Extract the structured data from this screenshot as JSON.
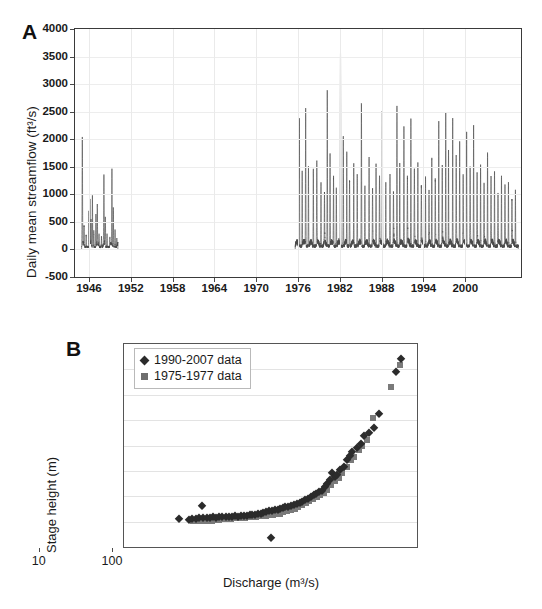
{
  "figure": {
    "panels": [
      {
        "letter": "A",
        "ylabel": "Daily mean streamflow (ft³/s)",
        "xlabel": ""
      },
      {
        "letter": "B",
        "ylabel": "Stage height (m)",
        "xlabel": "Discharge (m³/s)"
      }
    ]
  },
  "chart_data": [
    {
      "type": "line",
      "title": "",
      "panel": "A",
      "xlabel": "",
      "ylabel": "Daily mean streamflow (ft³/s)",
      "xlim": [
        1944.0,
        2008.0
      ],
      "ylim": [
        -500,
        4000
      ],
      "yticks": [
        -500,
        0,
        500,
        1000,
        1500,
        2000,
        2500,
        3000,
        3500,
        4000
      ],
      "ytick_labels": [
        "-500",
        "0",
        "500",
        "1000",
        "1500",
        "2000",
        "2500",
        "3000",
        "3500",
        "4000"
      ],
      "xticks": [
        1946,
        1952,
        1958,
        1964,
        1970,
        1976,
        1982,
        1988,
        1994,
        2000
      ],
      "xtick_labels": [
        "1946",
        "1952",
        "1958",
        "1964",
        "1970",
        "1976",
        "1982",
        "1988",
        "1994",
        "2000"
      ],
      "grid": true,
      "legend": "none",
      "series": [
        {
          "name": "Daily mean streamflow",
          "color": "#4a4a4a",
          "note": "Gauge record has two eras: an early record ~1945-1950 and a continuous record from ~1975 to ~2007; the 1951-1974 interval is a data gap.",
          "segments": [
            {
              "era": "1945-1950",
              "peaks": [
                {
                  "x": 1945.05,
                  "y": 1950
                },
                {
                  "x": 1945.3,
                  "y": 330
                },
                {
                  "x": 1945.6,
                  "y": 210
                },
                {
                  "x": 1946.0,
                  "y": 620
                },
                {
                  "x": 1946.15,
                  "y": 780
                },
                {
                  "x": 1946.3,
                  "y": 450
                },
                {
                  "x": 1946.5,
                  "y": 930
                },
                {
                  "x": 1946.7,
                  "y": 300
                },
                {
                  "x": 1947.0,
                  "y": 560
                },
                {
                  "x": 1947.2,
                  "y": 680
                },
                {
                  "x": 1947.45,
                  "y": 240
                },
                {
                  "x": 1947.8,
                  "y": 180
                },
                {
                  "x": 1948.15,
                  "y": 1260
                },
                {
                  "x": 1948.35,
                  "y": 500
                },
                {
                  "x": 1948.6,
                  "y": 230
                },
                {
                  "x": 1949.0,
                  "y": 160
                },
                {
                  "x": 1949.3,
                  "y": 1400
                },
                {
                  "x": 1949.5,
                  "y": 700
                },
                {
                  "x": 1949.75,
                  "y": 300
                },
                {
                  "x": 1950.0,
                  "y": 120
                }
              ]
            },
            {
              "era": "1975-2007",
              "annual_peaks": [
                {
                  "year": 1976.2,
                  "y": 2300
                },
                {
                  "year": 1976.6,
                  "y": 1350
                },
                {
                  "year": 1977.1,
                  "y": 2500
                },
                {
                  "year": 1977.5,
                  "y": 1450
                },
                {
                  "year": 1978.2,
                  "y": 1400
                },
                {
                  "year": 1978.7,
                  "y": 1500
                },
                {
                  "year": 1979.3,
                  "y": 1150
                },
                {
                  "year": 1979.8,
                  "y": 900
                },
                {
                  "year": 1980.2,
                  "y": 2850
                },
                {
                  "year": 1980.6,
                  "y": 1700
                },
                {
                  "year": 1981.1,
                  "y": 1250
                },
                {
                  "year": 1981.5,
                  "y": 1050
                },
                {
                  "year": 1982.1,
                  "y": 3500
                },
                {
                  "year": 1982.5,
                  "y": 2000
                },
                {
                  "year": 1983.0,
                  "y": 1700
                },
                {
                  "year": 1983.4,
                  "y": 1200
                },
                {
                  "year": 1984.0,
                  "y": 1450
                },
                {
                  "year": 1984.5,
                  "y": 1300
                },
                {
                  "year": 1985.1,
                  "y": 2600
                },
                {
                  "year": 1985.6,
                  "y": 1100
                },
                {
                  "year": 1986.2,
                  "y": 1600
                },
                {
                  "year": 1986.7,
                  "y": 1000
                },
                {
                  "year": 1987.2,
                  "y": 1500
                },
                {
                  "year": 1987.7,
                  "y": 1200
                },
                {
                  "year": 1988.1,
                  "y": 2450
                },
                {
                  "year": 1988.6,
                  "y": 1150
                },
                {
                  "year": 1989.2,
                  "y": 1300
                },
                {
                  "year": 1989.7,
                  "y": 950
                },
                {
                  "year": 1990.2,
                  "y": 2550
                },
                {
                  "year": 1990.6,
                  "y": 1500
                },
                {
                  "year": 1991.2,
                  "y": 2150
                },
                {
                  "year": 1991.7,
                  "y": 1200
                },
                {
                  "year": 1992.2,
                  "y": 2300
                },
                {
                  "year": 1992.7,
                  "y": 1350
                },
                {
                  "year": 1993.2,
                  "y": 1500
                },
                {
                  "year": 1993.7,
                  "y": 1050
                },
                {
                  "year": 1994.3,
                  "y": 1250
                },
                {
                  "year": 1994.8,
                  "y": 900
                },
                {
                  "year": 1995.2,
                  "y": 1600
                },
                {
                  "year": 1995.7,
                  "y": 1150
                },
                {
                  "year": 1996.2,
                  "y": 2250
                },
                {
                  "year": 1996.7,
                  "y": 1400
                },
                {
                  "year": 1997.2,
                  "y": 2400
                },
                {
                  "year": 1997.6,
                  "y": 1750
                },
                {
                  "year": 1998.2,
                  "y": 2300
                },
                {
                  "year": 1998.7,
                  "y": 1600
                },
                {
                  "year": 1999.2,
                  "y": 1900
                },
                {
                  "year": 1999.7,
                  "y": 1250
                },
                {
                  "year": 2000.2,
                  "y": 2050
                },
                {
                  "year": 2000.7,
                  "y": 1400
                },
                {
                  "year": 2001.2,
                  "y": 2200
                },
                {
                  "year": 2001.7,
                  "y": 1300
                },
                {
                  "year": 2002.2,
                  "y": 1500
                },
                {
                  "year": 2002.7,
                  "y": 1100
                },
                {
                  "year": 2003.2,
                  "y": 1700
                },
                {
                  "year": 2003.7,
                  "y": 1200
                },
                {
                  "year": 2004.2,
                  "y": 1350
                },
                {
                  "year": 2004.7,
                  "y": 900
                },
                {
                  "year": 2005.2,
                  "y": 1250
                },
                {
                  "year": 2005.7,
                  "y": 1050
                },
                {
                  "year": 2006.2,
                  "y": 1150
                },
                {
                  "year": 2006.7,
                  "y": 800
                },
                {
                  "year": 2007.2,
                  "y": 1000
                }
              ],
              "baseflow": 60
            }
          ]
        }
      ]
    },
    {
      "type": "scatter",
      "title": "",
      "panel": "B",
      "xlabel": "Discharge (m³/s)",
      "ylabel": "Stage height (m)",
      "xscale": "log",
      "xlim": [
        0.01,
        100
      ],
      "ylim": [
        0,
        4
      ],
      "xticks": [
        0.01,
        0.1,
        1,
        10,
        100
      ],
      "xtick_labels": [
        "0.01",
        "0.1",
        "1",
        "10",
        "100"
      ],
      "yticks": [
        0,
        0.5,
        1,
        1.5,
        2,
        2.5,
        3,
        3.5,
        4
      ],
      "ytick_labels": [
        "0",
        "0.5",
        "1",
        "1.5",
        "2",
        "2.5",
        "3",
        "3.5",
        "4"
      ],
      "grid": true,
      "legend_position": "top-left",
      "series": [
        {
          "name": "1990-2007 data",
          "marker": "diamond",
          "color": "#2b2b2b",
          "points": [
            [
              0.056,
              0.55
            ],
            [
              0.078,
              0.54
            ],
            [
              0.085,
              0.55
            ],
            [
              0.095,
              0.56
            ],
            [
              0.105,
              0.57
            ],
            [
              0.115,
              0.8
            ],
            [
              0.12,
              0.57
            ],
            [
              0.135,
              0.58
            ],
            [
              0.15,
              0.58
            ],
            [
              0.165,
              0.59
            ],
            [
              0.18,
              0.58
            ],
            [
              0.2,
              0.59
            ],
            [
              0.22,
              0.6
            ],
            [
              0.25,
              0.6
            ],
            [
              0.27,
              0.59
            ],
            [
              0.3,
              0.6
            ],
            [
              0.33,
              0.61
            ],
            [
              0.36,
              0.6
            ],
            [
              0.4,
              0.61
            ],
            [
              0.44,
              0.62
            ],
            [
              0.48,
              0.62
            ],
            [
              0.52,
              0.63
            ],
            [
              0.56,
              0.64
            ],
            [
              0.62,
              0.64
            ],
            [
              0.68,
              0.65
            ],
            [
              0.74,
              0.66
            ],
            [
              0.8,
              0.67
            ],
            [
              0.88,
              0.68
            ],
            [
              0.95,
              0.7
            ],
            [
              1.0,
              0.18
            ],
            [
              1.05,
              0.7
            ],
            [
              1.15,
              0.72
            ],
            [
              1.25,
              0.73
            ],
            [
              1.35,
              0.74
            ],
            [
              1.5,
              0.76
            ],
            [
              1.6,
              0.78
            ],
            [
              1.75,
              0.79
            ],
            [
              1.9,
              0.8
            ],
            [
              2.1,
              0.82
            ],
            [
              2.3,
              0.84
            ],
            [
              2.5,
              0.86
            ],
            [
              2.7,
              0.88
            ],
            [
              3.0,
              0.92
            ],
            [
              3.3,
              0.95
            ],
            [
              3.6,
              0.98
            ],
            [
              3.9,
              1.02
            ],
            [
              4.2,
              1.05
            ],
            [
              4.6,
              1.08
            ],
            [
              5.0,
              1.1
            ],
            [
              5.5,
              1.18
            ],
            [
              6.0,
              1.25
            ],
            [
              6.5,
              1.32
            ],
            [
              7.0,
              1.45
            ],
            [
              7.5,
              1.38
            ],
            [
              8.0,
              1.42
            ],
            [
              9.0,
              1.52
            ],
            [
              10.0,
              1.58
            ],
            [
              11.0,
              1.72
            ],
            [
              12.0,
              1.8
            ],
            [
              13.0,
              1.88
            ],
            [
              15.0,
              1.95
            ],
            [
              17.0,
              2.02
            ],
            [
              19.0,
              2.18
            ],
            [
              22.0,
              2.25
            ],
            [
              26.0,
              2.35
            ],
            [
              30.0,
              2.62
            ],
            [
              52.0,
              3.45
            ],
            [
              60.0,
              3.7
            ]
          ]
        },
        {
          "name": "1975-1977 data",
          "marker": "square",
          "color": "#7a7a7a",
          "points": [
            [
              0.088,
              0.52
            ],
            [
              0.1,
              0.52
            ],
            [
              0.115,
              0.51
            ],
            [
              0.13,
              0.51
            ],
            [
              0.145,
              0.52
            ],
            [
              0.16,
              0.52
            ],
            [
              0.18,
              0.53
            ],
            [
              0.2,
              0.54
            ],
            [
              0.23,
              0.55
            ],
            [
              0.26,
              0.56
            ],
            [
              0.29,
              0.56
            ],
            [
              0.32,
              0.57
            ],
            [
              0.36,
              0.57
            ],
            [
              0.4,
              0.58
            ],
            [
              0.45,
              0.58
            ],
            [
              0.5,
              0.59
            ],
            [
              0.56,
              0.6
            ],
            [
              0.63,
              0.6
            ],
            [
              0.7,
              0.61
            ],
            [
              0.78,
              0.62
            ],
            [
              0.87,
              0.62
            ],
            [
              0.97,
              0.63
            ],
            [
              1.08,
              0.64
            ],
            [
              1.2,
              0.65
            ],
            [
              1.35,
              0.66
            ],
            [
              1.5,
              0.68
            ],
            [
              1.7,
              0.7
            ],
            [
              1.9,
              0.72
            ],
            [
              2.15,
              0.75
            ],
            [
              2.4,
              0.78
            ],
            [
              2.7,
              0.82
            ],
            [
              3.05,
              0.86
            ],
            [
              3.4,
              0.9
            ],
            [
              3.8,
              0.94
            ],
            [
              4.3,
              0.99
            ],
            [
              4.8,
              1.03
            ],
            [
              5.4,
              1.06
            ],
            [
              6.0,
              1.12
            ],
            [
              6.8,
              1.22
            ],
            [
              7.6,
              1.3
            ],
            [
              8.5,
              1.36
            ],
            [
              9.5,
              1.45
            ],
            [
              11.0,
              1.58
            ],
            [
              12.5,
              1.72
            ],
            [
              14.0,
              1.78
            ],
            [
              16.0,
              1.92
            ],
            [
              18.0,
              2.0
            ],
            [
              21.0,
              2.1
            ],
            [
              25.0,
              2.55
            ],
            [
              44.0,
              3.15
            ],
            [
              58.0,
              3.58
            ]
          ]
        }
      ]
    }
  ]
}
